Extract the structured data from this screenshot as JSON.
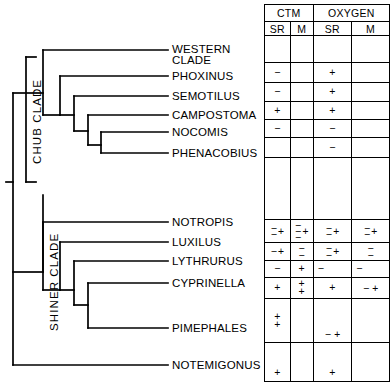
{
  "figure": {
    "type": "cladogram-with-character-matrix",
    "taxa": [
      {
        "id": "western-clade",
        "label": "WESTERN CLADE",
        "lines": [
          "WESTERN",
          "CLADE"
        ],
        "clade": "chub"
      },
      {
        "id": "phoxinus",
        "label": "PHOXINUS",
        "lines": [
          "PHOXINUS"
        ],
        "clade": "chub"
      },
      {
        "id": "semotilus",
        "label": "SEMOTILUS",
        "lines": [
          "SEMOTILUS"
        ],
        "clade": "chub"
      },
      {
        "id": "campostoma",
        "label": "CAMPOSTOMA",
        "lines": [
          "CAMPOSTOMA"
        ],
        "clade": "chub"
      },
      {
        "id": "nocomis",
        "label": "NOCOMIS",
        "lines": [
          "NOCOMIS"
        ],
        "clade": "chub"
      },
      {
        "id": "phenacobius",
        "label": "PHENACOBIUS",
        "lines": [
          "PHENACOBIUS"
        ],
        "clade": "chub"
      },
      {
        "id": "notropis",
        "label": "NOTROPIS",
        "lines": [
          "NOTROPIS"
        ],
        "clade": "shiner"
      },
      {
        "id": "luxilus",
        "label": "LUXILUS",
        "lines": [
          "LUXILUS"
        ],
        "clade": "shiner"
      },
      {
        "id": "lythrurus",
        "label": "LYTHRURUS",
        "lines": [
          "LYTHRURUS"
        ],
        "clade": "shiner"
      },
      {
        "id": "cyprinella",
        "label": "CYPRINELLA",
        "lines": [
          "CYPRINELLA"
        ],
        "clade": "shiner"
      },
      {
        "id": "pimephales",
        "label": "PIMEPHALES",
        "lines": [
          "PIMEPHALES"
        ],
        "clade": "shiner"
      },
      {
        "id": "notemigonus",
        "label": "NOTEMIGONUS",
        "lines": [
          "NOTEMIGONUS"
        ],
        "clade": "outgroup"
      }
    ],
    "clade_labels": [
      {
        "id": "chub",
        "label": "CHUB CLADE"
      },
      {
        "id": "shiner",
        "label": "SHINER CLADE"
      }
    ]
  },
  "matrix": {
    "groups": [
      {
        "id": "ctm",
        "label": "CTM"
      },
      {
        "id": "oxygen",
        "label": "OXYGEN"
      }
    ],
    "subheaders": [
      {
        "id": "ctm-sr",
        "label": "SR"
      },
      {
        "id": "ctm-m",
        "label": "M"
      },
      {
        "id": "oxygen-sr",
        "label": "SR"
      },
      {
        "id": "oxygen-m",
        "label": "M"
      }
    ],
    "symbols": {
      "plus": "+",
      "minus": "−",
      "equals": "═"
    },
    "rows": [
      {
        "taxon": "WESTERN CLADE",
        "ctm_sr": [],
        "ctm_m": [],
        "oxygen_sr": [],
        "oxygen_m": []
      },
      {
        "taxon": "PHOXINUS",
        "ctm_sr": [
          "−"
        ],
        "ctm_m": [],
        "oxygen_sr": [
          "+"
        ],
        "oxygen_m": []
      },
      {
        "taxon": "SEMOTILUS",
        "ctm_sr": [
          "−"
        ],
        "ctm_m": [],
        "oxygen_sr": [
          "+"
        ],
        "oxygen_m": []
      },
      {
        "taxon": "CAMPOSTOMA",
        "ctm_sr": [
          "+"
        ],
        "ctm_m": [],
        "oxygen_sr": [
          "+"
        ],
        "oxygen_m": []
      },
      {
        "taxon": "NOCOMIS",
        "ctm_sr": [
          "−"
        ],
        "ctm_m": [],
        "oxygen_sr": [
          "−"
        ],
        "oxygen_m": []
      },
      {
        "taxon": "PHENACOBIUS",
        "ctm_sr": [],
        "ctm_m": [],
        "oxygen_sr": [
          "−"
        ],
        "oxygen_m": []
      },
      {
        "taxon": "BLANK",
        "ctm_sr": [],
        "ctm_m": [],
        "oxygen_sr": [],
        "oxygen_m": []
      },
      {
        "taxon": "NOTROPIS",
        "ctm_sr": [
          "−−",
          "+"
        ],
        "ctm_m": [
          "−−−",
          "+"
        ],
        "oxygen_sr": [
          "−−",
          "+"
        ],
        "oxygen_m": [
          "−−",
          "+"
        ]
      },
      {
        "taxon": "LUXILUS",
        "ctm_sr": [
          "−",
          "+"
        ],
        "ctm_m": [
          "−−"
        ],
        "oxygen_sr": [
          "−−",
          "+"
        ],
        "oxygen_m": [
          "−−"
        ]
      },
      {
        "taxon": "LYTHRURUS",
        "ctm_sr": [
          "−"
        ],
        "ctm_m": [
          "+"
        ],
        "oxygen_sr": [
          "−"
        ],
        "oxygen_m": [
          "−"
        ]
      },
      {
        "taxon": "CYPRINELLA",
        "ctm_sr": [
          "+"
        ],
        "ctm_m": [
          "+",
          "+"
        ],
        "oxygen_sr": [
          "+"
        ],
        "oxygen_m": [
          "−",
          "+"
        ]
      },
      {
        "taxon": "PIMEPHALES",
        "ctm_sr": [
          "+",
          "+"
        ],
        "ctm_m": [],
        "oxygen_sr": [
          "−",
          "+"
        ],
        "oxygen_m": []
      },
      {
        "taxon": "NOTEMIGONUS",
        "ctm_sr": [
          "+"
        ],
        "ctm_m": [],
        "oxygen_sr": [
          "+"
        ],
        "oxygen_m": []
      }
    ]
  }
}
